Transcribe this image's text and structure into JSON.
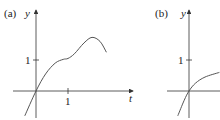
{
  "panels": [
    {
      "label": "(a)",
      "y_axis_label": "y",
      "x_axis_label": "t",
      "y_tick_label": "1",
      "x_tick_label": "1",
      "curve_points": [
        [
          -0.35,
          -0.8
        ],
        [
          0,
          0
        ],
        [
          0.3,
          0.55
        ],
        [
          0.6,
          0.9
        ],
        [
          0.85,
          1.02
        ],
        [
          1.0,
          1.05
        ],
        [
          1.2,
          1.2
        ],
        [
          1.5,
          1.55
        ],
        [
          1.75,
          1.73
        ],
        [
          2.0,
          1.6
        ],
        [
          2.2,
          1.25
        ]
      ]
    },
    {
      "label": "(b)",
      "y_axis_label": "y",
      "x_axis_label": "",
      "y_tick_label": "1",
      "curve_points": [
        [
          -0.35,
          -0.8
        ],
        [
          -0.15,
          -0.3
        ],
        [
          0,
          0
        ],
        [
          0.2,
          0.25
        ],
        [
          0.5,
          0.45
        ],
        [
          0.95,
          0.6
        ]
      ]
    }
  ],
  "colors": {
    "axis": "#333333",
    "curve": "#555555"
  }
}
